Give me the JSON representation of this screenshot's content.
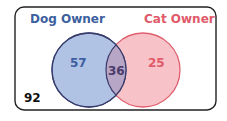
{
  "diagram": {
    "type": "venn",
    "sets": [
      {
        "name": "Dog Owner",
        "only_count": "57",
        "color": "#3d5fa0",
        "fill": "#a9bfe3"
      },
      {
        "name": "Cat Owner",
        "only_count": "25",
        "color": "#e05a6a",
        "fill": "#f7c1c6"
      }
    ],
    "intersection": {
      "count": "36",
      "color": "#4a3a6a"
    },
    "outside": {
      "count": "92",
      "color": "#111111"
    }
  }
}
